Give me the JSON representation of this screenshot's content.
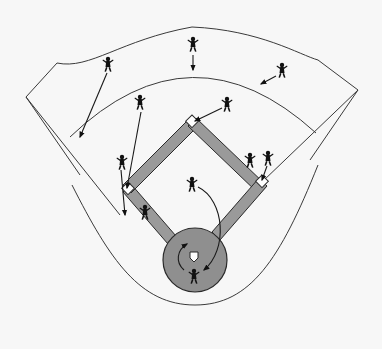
{
  "diagram": {
    "colors": {
      "background": "#f7f7f7",
      "line": "#3a3a3a",
      "basepath": "#9a9a9a",
      "home_circle": "#8f8f8f",
      "player": "#111111",
      "base": "#ffffff"
    },
    "field": {
      "outfield_wall": "M26,97 L57,63 C90,70 120,40 192,27 C260,30 300,55 318,60 L358,90",
      "left_foul_outer": "M26,97 L120,215",
      "left_foul_inner": "M26,97 L80,175",
      "right_foul_outer": "M358,90 L262,182",
      "right_foul_inner": "M358,90 L310,160",
      "grass_arc": "M70,137 Q192,20 316,133",
      "foul_territory_curve": "M72,185 C110,260 140,305 195,305 C250,305 280,260 318,165"
    },
    "bases": [
      {
        "name": "second-base",
        "x": 192,
        "y": 122
      },
      {
        "name": "third-base",
        "x": 128,
        "y": 189
      },
      {
        "name": "first-base",
        "x": 262,
        "y": 182
      },
      {
        "name": "home-plate",
        "x": 194,
        "y": 258
      }
    ],
    "home_circle": {
      "cx": 195,
      "cy": 260,
      "r": 32
    },
    "players": [
      {
        "name": "center-fielder",
        "x": 193,
        "y": 44
      },
      {
        "name": "left-fielder",
        "x": 108,
        "y": 64
      },
      {
        "name": "right-fielder",
        "x": 282,
        "y": 70
      },
      {
        "name": "shortstop",
        "x": 140,
        "y": 102
      },
      {
        "name": "second-baseman",
        "x": 227,
        "y": 104
      },
      {
        "name": "third-base-coach-runner",
        "x": 122,
        "y": 162
      },
      {
        "name": "first-baseman",
        "x": 250,
        "y": 160
      },
      {
        "name": "first-base-runner",
        "x": 268,
        "y": 158
      },
      {
        "name": "third-baseman",
        "x": 145,
        "y": 212
      },
      {
        "name": "pitcher",
        "x": 192,
        "y": 184
      },
      {
        "name": "catcher",
        "x": 194,
        "y": 276
      }
    ],
    "arrows": [
      {
        "name": "cf-arrow",
        "d": "M193,55 L193,70",
        "head": [
          193,
          71
        ]
      },
      {
        "name": "lf-arrow",
        "d": "M107,73 L80,137",
        "head": [
          80,
          138
        ]
      },
      {
        "name": "rf-arrow",
        "d": "M276,76 L261,84",
        "head": [
          260,
          85
        ]
      },
      {
        "name": "ss-arrow",
        "d": "M141,112 L127,188",
        "head": [
          127,
          189
        ]
      },
      {
        "name": "2b-arrow",
        "d": "M222,108 L195,121",
        "head": [
          194,
          122
        ]
      },
      {
        "name": "3b-runner-arrow",
        "d": "M121,170 L125,215",
        "head": [
          125,
          216
        ]
      },
      {
        "name": "1b-runner-arrow",
        "d": "M267,166 L262,180",
        "head": [
          262,
          181
        ]
      },
      {
        "name": "pitcher-arrow",
        "d": "M198,187 C225,200 228,250 204,270",
        "head": [
          203,
          271
        ]
      },
      {
        "name": "catcher-arrow",
        "d": "M184,270 C175,262 177,250 187,244",
        "head": [
          188,
          243
        ]
      }
    ]
  }
}
